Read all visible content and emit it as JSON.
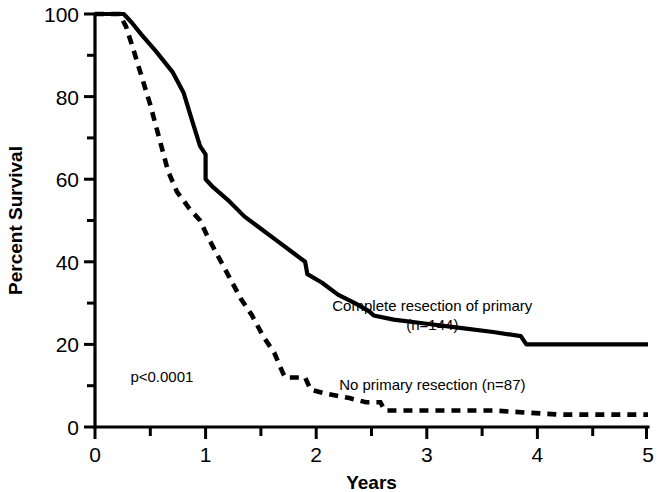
{
  "chart_data": {
    "type": "line",
    "title": "",
    "xlabel": "Years",
    "ylabel": "Percent Survival",
    "xlim": [
      0,
      5
    ],
    "ylim": [
      0,
      100
    ],
    "grid": false,
    "legend_position": "inline-right",
    "x_ticks": [
      "0",
      "1",
      "2",
      "3",
      "4",
      "5"
    ],
    "x_tick_values": [
      0,
      1,
      2,
      3,
      4,
      5
    ],
    "x_minor_values": [
      0.5,
      1.5,
      2.5,
      3.5,
      4.5
    ],
    "y_ticks": [
      "0",
      "20",
      "40",
      "60",
      "80",
      "100"
    ],
    "y_tick_values": [
      0,
      20,
      40,
      60,
      80,
      100
    ],
    "y_minor_values": [
      10,
      30,
      50,
      70,
      90
    ],
    "annotations": [
      {
        "name": "p-value",
        "text": "p<0.0001",
        "x": 0.32,
        "y": 11
      }
    ],
    "series": [
      {
        "name": "Complete resection of primary",
        "label": "Complete resection of primary",
        "sublabel": "(n=144)",
        "n": 144,
        "style": "solid",
        "color": "#000000",
        "label_x": 3.05,
        "label_y": 28,
        "points": [
          [
            0.0,
            100
          ],
          [
            0.26,
            100
          ],
          [
            0.33,
            98
          ],
          [
            0.42,
            95
          ],
          [
            0.55,
            91
          ],
          [
            0.7,
            86
          ],
          [
            0.8,
            81
          ],
          [
            0.88,
            74
          ],
          [
            0.95,
            68
          ],
          [
            1.0,
            66
          ],
          [
            1.0,
            60
          ],
          [
            1.07,
            58
          ],
          [
            1.2,
            55
          ],
          [
            1.35,
            51
          ],
          [
            1.5,
            48
          ],
          [
            1.65,
            45
          ],
          [
            1.8,
            42
          ],
          [
            1.9,
            40
          ],
          [
            1.92,
            37
          ],
          [
            2.05,
            35
          ],
          [
            2.2,
            32
          ],
          [
            2.35,
            30
          ],
          [
            2.48,
            28
          ],
          [
            2.52,
            27
          ],
          [
            2.7,
            26
          ],
          [
            3.0,
            25
          ],
          [
            3.3,
            24
          ],
          [
            3.6,
            23
          ],
          [
            3.85,
            22
          ],
          [
            3.9,
            20
          ],
          [
            4.3,
            20
          ],
          [
            5.0,
            20
          ]
        ]
      },
      {
        "name": "No primary resection",
        "label": "No primary resection (n=87)",
        "sublabel": "",
        "n": 87,
        "style": "dashed",
        "color": "#000000",
        "label_x": 3.05,
        "label_y": 9,
        "points": [
          [
            0.0,
            100
          ],
          [
            0.22,
            100
          ],
          [
            0.28,
            97
          ],
          [
            0.34,
            92
          ],
          [
            0.42,
            85
          ],
          [
            0.5,
            78
          ],
          [
            0.58,
            70
          ],
          [
            0.66,
            62
          ],
          [
            0.74,
            57
          ],
          [
            0.85,
            53
          ],
          [
            0.95,
            50
          ],
          [
            1.02,
            46
          ],
          [
            1.12,
            41
          ],
          [
            1.22,
            36
          ],
          [
            1.32,
            31
          ],
          [
            1.42,
            27
          ],
          [
            1.52,
            22
          ],
          [
            1.62,
            18
          ],
          [
            1.7,
            13
          ],
          [
            1.72,
            12
          ],
          [
            1.9,
            12
          ],
          [
            1.95,
            9
          ],
          [
            2.1,
            8
          ],
          [
            2.3,
            7
          ],
          [
            2.45,
            6
          ],
          [
            2.58,
            6
          ],
          [
            2.62,
            4
          ],
          [
            3.0,
            4
          ],
          [
            3.6,
            4
          ],
          [
            4.2,
            3
          ],
          [
            5.0,
            3
          ]
        ]
      }
    ]
  },
  "geometry": {
    "plot_left": 95,
    "plot_right": 648,
    "plot_top": 14,
    "plot_bottom": 427
  }
}
